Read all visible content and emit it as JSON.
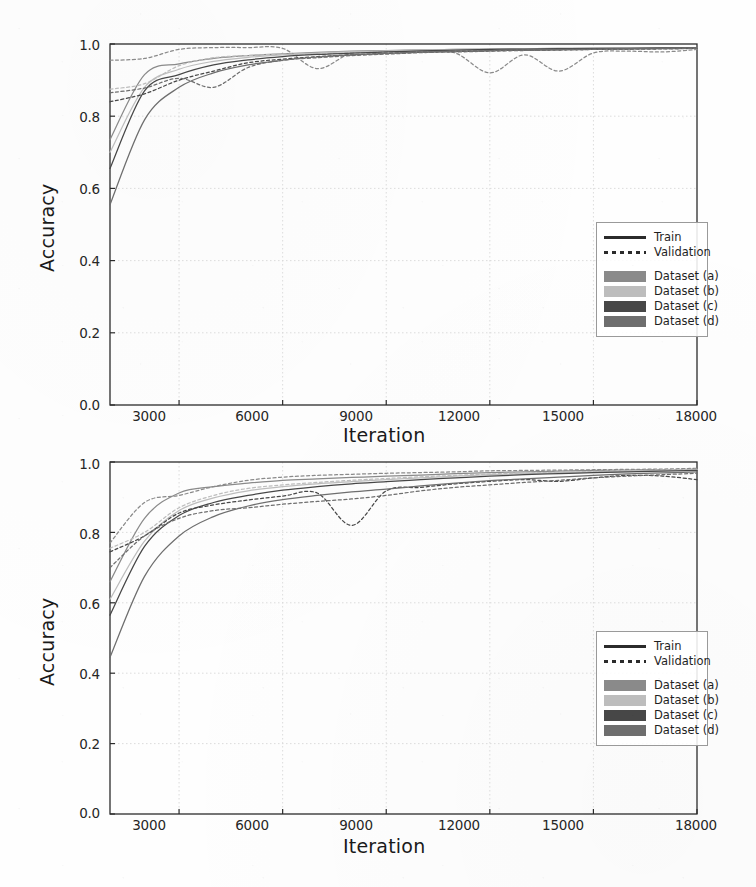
{
  "figure": {
    "panels": [
      "top",
      "bottom"
    ],
    "background_color": "#fefefe",
    "axis_color": "#2b2b2b",
    "grid_color": "#d8d8d8"
  },
  "legend": {
    "style_entries": [
      {
        "label": "Train",
        "key": "solid-line",
        "color": "#2b2b2b"
      },
      {
        "label": "Validation",
        "key": "dotted-line",
        "color": "#2b2b2b"
      }
    ],
    "dataset_entries": [
      {
        "label": "Dataset (a)",
        "color": "#8a8a8a"
      },
      {
        "label": "Dataset (b)",
        "color": "#bdbdbd"
      },
      {
        "label": "Dataset (c)",
        "color": "#474747"
      },
      {
        "label": "Dataset (d)",
        "color": "#6e6e6e"
      }
    ]
  },
  "chart_data": [
    {
      "type": "line",
      "panel": "top",
      "title": "",
      "xlabel": "Iteration",
      "ylabel": "Accuracy",
      "xlim": [
        1000,
        18000
      ],
      "ylim": [
        0.0,
        1.0
      ],
      "xticks": [
        3000,
        6000,
        9000,
        12000,
        15000,
        18000
      ],
      "xtick_labels": [
        "3000",
        "6000",
        "9000",
        "12000",
        "15000",
        "18000"
      ],
      "yticks": [
        0.0,
        0.2,
        0.4,
        0.6,
        0.8,
        1.0
      ],
      "ytick_labels": [
        "0.0",
        "0.2",
        "0.4",
        "0.6",
        "0.8",
        "1.0"
      ],
      "grid": true,
      "legend_position": "lower right",
      "x": [
        1000,
        2000,
        3000,
        4000,
        5000,
        6000,
        7000,
        8000,
        9000,
        10000,
        11000,
        12000,
        13000,
        14000,
        15000,
        16000,
        17000,
        18000
      ],
      "series": [
        {
          "name": "Dataset (a) Train",
          "dataset": "Dataset (a)",
          "split": "Train",
          "style": "solid",
          "color": "#8a8a8a",
          "values": [
            0.735,
            0.915,
            0.945,
            0.96,
            0.968,
            0.973,
            0.977,
            0.98,
            0.982,
            0.984,
            0.985,
            0.986,
            0.987,
            0.988,
            0.988,
            0.989,
            0.989,
            0.99
          ]
        },
        {
          "name": "Dataset (a) Validation",
          "dataset": "Dataset (a)",
          "split": "Validation",
          "style": "dotted",
          "color": "#8a8a8a",
          "values": [
            0.955,
            0.96,
            0.985,
            0.99,
            0.99,
            0.988,
            0.932,
            0.975,
            0.978,
            0.98,
            0.975,
            0.92,
            0.97,
            0.925,
            0.975,
            0.98,
            0.978,
            0.985
          ]
        },
        {
          "name": "Dataset (b) Train",
          "dataset": "Dataset (b)",
          "split": "Train",
          "style": "solid",
          "color": "#bdbdbd",
          "values": [
            0.7,
            0.88,
            0.93,
            0.952,
            0.963,
            0.97,
            0.975,
            0.979,
            0.981,
            0.983,
            0.985,
            0.986,
            0.987,
            0.988,
            0.988,
            0.989,
            0.989,
            0.99
          ]
        },
        {
          "name": "Dataset (b) Validation",
          "dataset": "Dataset (b)",
          "split": "Validation",
          "style": "dotted",
          "color": "#bdbdbd",
          "values": [
            0.875,
            0.89,
            0.94,
            0.962,
            0.968,
            0.972,
            0.972,
            0.976,
            0.978,
            0.98,
            0.981,
            0.982,
            0.983,
            0.984,
            0.985,
            0.986,
            0.986,
            0.987
          ]
        },
        {
          "name": "Dataset (c) Train",
          "dataset": "Dataset (c)",
          "split": "Train",
          "style": "solid",
          "color": "#474747",
          "values": [
            0.655,
            0.87,
            0.915,
            0.942,
            0.956,
            0.965,
            0.971,
            0.975,
            0.978,
            0.981,
            0.983,
            0.985,
            0.986,
            0.987,
            0.988,
            0.988,
            0.989,
            0.989
          ]
        },
        {
          "name": "Dataset (c) Validation",
          "dataset": "Dataset (c)",
          "split": "Validation",
          "style": "dotted",
          "color": "#474747",
          "values": [
            0.84,
            0.862,
            0.9,
            0.925,
            0.948,
            0.958,
            0.965,
            0.97,
            0.974,
            0.977,
            0.979,
            0.981,
            0.983,
            0.984,
            0.985,
            0.986,
            0.987,
            0.988
          ]
        },
        {
          "name": "Dataset (d) Train",
          "dataset": "Dataset (d)",
          "split": "Train",
          "style": "solid",
          "color": "#6e6e6e",
          "values": [
            0.555,
            0.79,
            0.88,
            0.92,
            0.942,
            0.955,
            0.964,
            0.97,
            0.974,
            0.978,
            0.98,
            0.982,
            0.984,
            0.985,
            0.986,
            0.987,
            0.988,
            0.989
          ]
        },
        {
          "name": "Dataset (d) Validation",
          "dataset": "Dataset (d)",
          "split": "Validation",
          "style": "dotted",
          "color": "#6e6e6e",
          "values": [
            0.865,
            0.878,
            0.905,
            0.88,
            0.935,
            0.955,
            0.962,
            0.968,
            0.972,
            0.976,
            0.978,
            0.98,
            0.982,
            0.983,
            0.985,
            0.986,
            0.987,
            0.988
          ]
        }
      ]
    },
    {
      "type": "line",
      "panel": "bottom",
      "title": "",
      "xlabel": "Iteration",
      "ylabel": "Accuracy",
      "xlim": [
        1000,
        18000
      ],
      "ylim": [
        0.0,
        1.0
      ],
      "xticks": [
        3000,
        6000,
        9000,
        12000,
        15000,
        18000
      ],
      "xtick_labels": [
        "3000",
        "6000",
        "9000",
        "12000",
        "15000",
        "18000"
      ],
      "yticks": [
        0.0,
        0.2,
        0.4,
        0.6,
        0.8,
        1.0
      ],
      "ytick_labels": [
        "0.0",
        "0.2",
        "0.4",
        "0.6",
        "0.8",
        "1.0"
      ],
      "grid": true,
      "legend_position": "lower right",
      "x": [
        1000,
        2000,
        3000,
        4000,
        5000,
        6000,
        7000,
        8000,
        9000,
        10000,
        11000,
        12000,
        13000,
        14000,
        15000,
        16000,
        17000,
        18000
      ],
      "series": [
        {
          "name": "Dataset (a) Train",
          "dataset": "Dataset (a)",
          "split": "Train",
          "style": "solid",
          "color": "#8a8a8a",
          "values": [
            0.66,
            0.84,
            0.912,
            0.93,
            0.94,
            0.948,
            0.952,
            0.956,
            0.96,
            0.963,
            0.967,
            0.97,
            0.972,
            0.974,
            0.976,
            0.977,
            0.978,
            0.98
          ]
        },
        {
          "name": "Dataset (a) Validation",
          "dataset": "Dataset (a)",
          "split": "Validation",
          "style": "dotted",
          "color": "#8a8a8a",
          "values": [
            0.77,
            0.885,
            0.905,
            0.93,
            0.948,
            0.957,
            0.962,
            0.965,
            0.968,
            0.97,
            0.972,
            0.975,
            0.976,
            0.977,
            0.978,
            0.979,
            0.98,
            0.982
          ]
        },
        {
          "name": "Dataset (b) Train",
          "dataset": "Dataset (b)",
          "split": "Train",
          "style": "solid",
          "color": "#bdbdbd",
          "values": [
            0.61,
            0.775,
            0.862,
            0.898,
            0.918,
            0.93,
            0.938,
            0.944,
            0.95,
            0.955,
            0.96,
            0.964,
            0.967,
            0.97,
            0.972,
            0.974,
            0.976,
            0.978
          ]
        },
        {
          "name": "Dataset (b) Validation",
          "dataset": "Dataset (b)",
          "split": "Validation",
          "style": "dotted",
          "color": "#bdbdbd",
          "values": [
            0.755,
            0.8,
            0.87,
            0.905,
            0.925,
            0.935,
            0.942,
            0.948,
            0.953,
            0.958,
            0.962,
            0.966,
            0.969,
            0.971,
            0.973,
            0.975,
            0.977,
            0.979
          ]
        },
        {
          "name": "Dataset (c) Train",
          "dataset": "Dataset (c)",
          "split": "Train",
          "style": "solid",
          "color": "#474747",
          "values": [
            0.565,
            0.76,
            0.848,
            0.885,
            0.905,
            0.92,
            0.93,
            0.938,
            0.944,
            0.95,
            0.955,
            0.96,
            0.964,
            0.967,
            0.97,
            0.972,
            0.974,
            0.976
          ]
        },
        {
          "name": "Dataset (c) Validation",
          "dataset": "Dataset (c)",
          "split": "Validation",
          "style": "dotted",
          "color": "#474747",
          "values": [
            0.745,
            0.79,
            0.855,
            0.878,
            0.892,
            0.903,
            0.912,
            0.82,
            0.918,
            0.928,
            0.938,
            0.945,
            0.95,
            0.945,
            0.955,
            0.962,
            0.96,
            0.95
          ]
        },
        {
          "name": "Dataset (d) Train",
          "dataset": "Dataset (d)",
          "split": "Train",
          "style": "solid",
          "color": "#6e6e6e",
          "values": [
            0.445,
            0.675,
            0.79,
            0.845,
            0.875,
            0.893,
            0.905,
            0.915,
            0.923,
            0.932,
            0.94,
            0.947,
            0.952,
            0.957,
            0.962,
            0.966,
            0.969,
            0.972
          ]
        },
        {
          "name": "Dataset (d) Validation",
          "dataset": "Dataset (d)",
          "split": "Validation",
          "style": "dotted",
          "color": "#6e6e6e",
          "values": [
            0.7,
            0.79,
            0.84,
            0.862,
            0.87,
            0.88,
            0.888,
            0.895,
            0.905,
            0.918,
            0.928,
            0.935,
            0.942,
            0.948,
            0.955,
            0.96,
            0.964,
            0.968
          ]
        }
      ]
    }
  ]
}
